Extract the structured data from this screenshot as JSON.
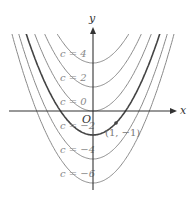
{
  "figure": {
    "equation_family": "y = x^2 + c",
    "axes": {
      "x_label": "x",
      "y_label": "y",
      "origin_label": "O"
    },
    "curves": [
      {
        "c": 4,
        "label": "c = 4",
        "bold": false
      },
      {
        "c": 2,
        "label": "c = 2",
        "bold": false
      },
      {
        "c": 0,
        "label": "c = 0",
        "bold": false
      },
      {
        "c": -2,
        "label": "c = −2",
        "bold": true
      },
      {
        "c": -4,
        "label": "c = −4",
        "bold": false
      },
      {
        "c": -6,
        "label": "c = −6",
        "bold": false
      }
    ],
    "point": {
      "x": 1,
      "y": -1,
      "label": "(1, −1)"
    },
    "colors": {
      "curve": "#8a8a8a",
      "highlight_curve": "#444444",
      "axis": "#333333"
    }
  }
}
